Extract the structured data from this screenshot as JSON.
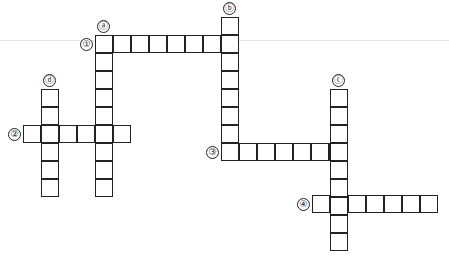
{
  "puzzle": {
    "type": "crossword",
    "cell_size": 18,
    "across": [
      {
        "label": "①",
        "x": 95,
        "y": 35,
        "length": 8,
        "label_x": 80,
        "label_y": 38
      },
      {
        "label": "②",
        "x": 23,
        "y": 125,
        "length": 6,
        "label_x": 8,
        "label_y": 128
      },
      {
        "label": "③",
        "x": 221,
        "y": 143,
        "length": 7,
        "label_x": 206,
        "label_y": 146
      },
      {
        "label": "④",
        "x": 312,
        "y": 195,
        "length": 7,
        "label_x": 297,
        "label_y": 198
      }
    ],
    "down": [
      {
        "label": "ⓐ",
        "x": 95,
        "y": 35,
        "length": 9,
        "label_x": 97,
        "label_y": 20
      },
      {
        "label": "ⓑ",
        "x": 221,
        "y": 17,
        "length": 8,
        "label_x": 223,
        "label_y": 2
      },
      {
        "label": "ⓒ",
        "x": 330,
        "y": 89,
        "length": 9,
        "label_x": 332,
        "label_y": 74
      },
      {
        "label": "ⓓ",
        "x": 41,
        "y": 89,
        "length": 6,
        "label_x": 43,
        "label_y": 74
      }
    ]
  }
}
